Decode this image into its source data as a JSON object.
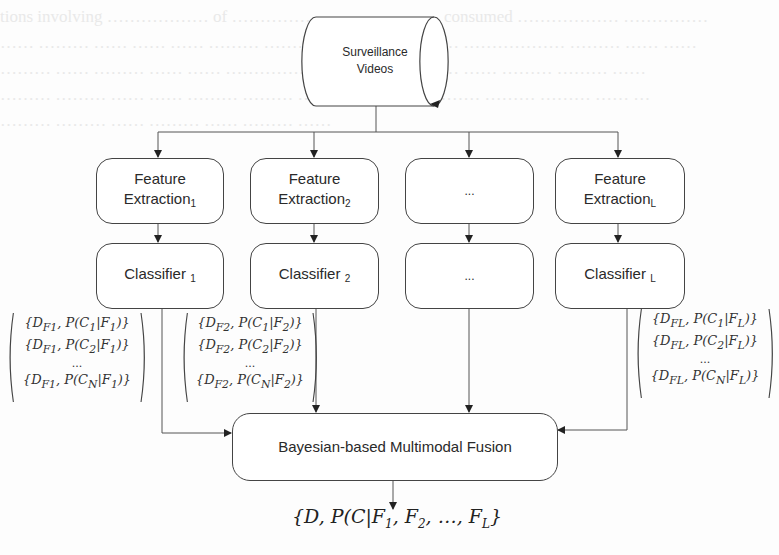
{
  "diagram": {
    "source": {
      "label_line1": "Surveillance",
      "label_line2": "Videos",
      "shape": "cylinder"
    },
    "feature_extraction": [
      {
        "label": "Feature",
        "label2": "Extraction",
        "subscript": "1"
      },
      {
        "label": "Feature",
        "label2": "Extraction",
        "subscript": "2"
      },
      {
        "label": "...",
        "label2": "",
        "subscript": ""
      },
      {
        "label": "Feature",
        "label2": "Extraction",
        "subscript": "L"
      }
    ],
    "classifiers": [
      {
        "label": "Classifier ",
        "subscript": "1"
      },
      {
        "label": "Classifier ",
        "subscript": "2"
      },
      {
        "label": "...",
        "subscript": ""
      },
      {
        "label": "Classifier ",
        "subscript": "L"
      }
    ],
    "classifier_outputs": [
      {
        "rows": [
          "{D_F1, P(C_1|F_1)}",
          "{D_F1, P(C_2|F_1)}",
          "...",
          "{D_F1, P(C_N|F_1)}"
        ],
        "display": [
          "{D",
          "F1",
          ", P(C",
          "1",
          "|F",
          "1",
          ")}"
        ]
      },
      {
        "rows": [
          "{D_F2, P(C_1|F_2)}",
          "{D_F2, P(C_2|F_2)}",
          "...",
          "{D_F2, P(C_N|F_2)}"
        ]
      },
      {
        "rows": [
          "{D_FL, P(C_1|F_L)}",
          "{D_FL, P(C_2|F_L)}",
          "...",
          "{D_FL, P(C_N|F_L)}"
        ]
      }
    ],
    "fusion": {
      "label": "Bayesian-based Multimodal Fusion"
    },
    "output": {
      "label": "{D, P(C|F1, F2, ..., FL}"
    }
  },
  "matrix_text": {
    "m1": {
      "r1a": "{D",
      "r1b": "F1",
      "r1c": ", P(C",
      "r1d": "1",
      "r1e": "|F",
      "r1f": "1",
      "r1g": ")}",
      "r2d": "2",
      "r3": "...",
      "r4d": "N"
    },
    "m2": {
      "sub": "F2",
      "f": "2"
    },
    "mL": {
      "sub": "FL",
      "f": "L"
    },
    "dots": "..."
  },
  "colors": {
    "line": "#555555",
    "box_border": "#444444",
    "text": "#2a2a2a",
    "background": "#fdfdfd"
  }
}
